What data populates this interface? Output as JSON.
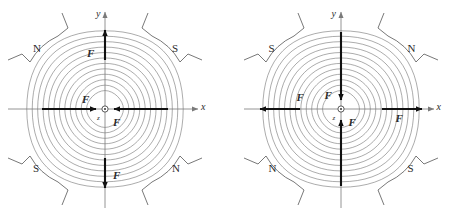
{
  "figure": {
    "type": "magnetic-quadrupole-field-diagram-pair",
    "background_color": "#ffffff",
    "line_color": "#555555",
    "axis_color": "#7a7a7a",
    "arrow_color": "#111111",
    "text_color": "#2b2b2b"
  },
  "panels": [
    {
      "id": "left",
      "name": "focusing-quadrupole",
      "poles": [
        {
          "position": "top-left",
          "label": "N"
        },
        {
          "position": "top-right",
          "label": "S"
        },
        {
          "position": "bottom-left",
          "label": "S"
        },
        {
          "position": "bottom-right",
          "label": "N"
        }
      ],
      "axes": {
        "x_label": "x",
        "y_label": "y",
        "z_label": "z",
        "x_direction": "right",
        "y_direction": "up",
        "origin_marker": "circle-dot-out-of-page"
      },
      "forces": [
        {
          "id": "f-up",
          "label": "F",
          "axis": "y",
          "direction": "up",
          "sense": "outward"
        },
        {
          "id": "f-down",
          "label": "F",
          "axis": "y",
          "direction": "down",
          "sense": "outward"
        },
        {
          "id": "f-left",
          "label": "F",
          "axis": "x",
          "direction": "right",
          "sense": "inward"
        },
        {
          "id": "f-right",
          "label": "F",
          "axis": "x",
          "direction": "left",
          "sense": "inward"
        }
      ],
      "field_lines_per_quadrant": 12
    },
    {
      "id": "right",
      "name": "defocusing-quadrupole",
      "poles": [
        {
          "position": "top-left",
          "label": "S"
        },
        {
          "position": "top-right",
          "label": "N"
        },
        {
          "position": "bottom-left",
          "label": "N"
        },
        {
          "position": "bottom-right",
          "label": "S"
        }
      ],
      "axes": {
        "x_label": "x",
        "y_label": "y",
        "z_label": "z",
        "x_direction": "right",
        "y_direction": "up",
        "origin_marker": "circle-dot-out-of-page"
      },
      "forces": [
        {
          "id": "f-up",
          "label": "F",
          "axis": "y",
          "direction": "down",
          "sense": "inward"
        },
        {
          "id": "f-down",
          "label": "F",
          "axis": "y",
          "direction": "up",
          "sense": "inward"
        },
        {
          "id": "f-left",
          "label": "F",
          "axis": "x",
          "direction": "left",
          "sense": "outward"
        },
        {
          "id": "f-right",
          "label": "F",
          "axis": "x",
          "direction": "right",
          "sense": "outward"
        }
      ],
      "field_lines_per_quadrant": 12
    }
  ]
}
